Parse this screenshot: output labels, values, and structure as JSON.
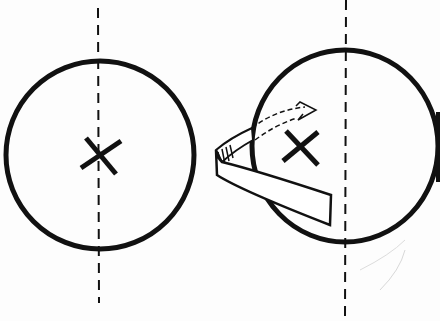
{
  "diagram": {
    "colors": {
      "ink": "#111111",
      "background": "#fdfdfd",
      "faint": "#cccccc"
    },
    "left_figure": {
      "circle": {
        "cx": 100,
        "cy": 155,
        "r": 94
      },
      "axis_x": 98,
      "axis_range": [
        8,
        303
      ],
      "center_mark": {
        "x": 100,
        "y": 155,
        "label": "×"
      }
    },
    "right_figure": {
      "circle": {
        "cx": 345,
        "cy": 146,
        "rx": 93,
        "ry": 96
      },
      "axis_x": 346,
      "axis_range": [
        0,
        318
      ],
      "center_mark": {
        "x": 300,
        "y": 148,
        "label": "×"
      },
      "rotation_ribbon": true,
      "rotation_arrow": "dashed"
    }
  }
}
